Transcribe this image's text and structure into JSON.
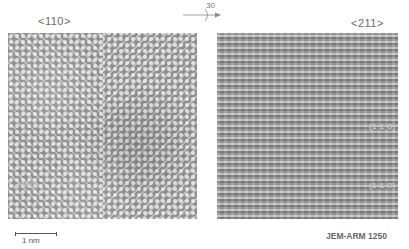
{
  "figure": {
    "left_panel": {
      "zone_axis_label": "<110>",
      "plane_label": "(200)",
      "pattern": "twinned-lattice-chevron"
    },
    "right_panel": {
      "zone_axis_label": "<211>",
      "plane_labels": [
        "(1 1 0)",
        "(1 1 0)"
      ],
      "pattern": "horizontal-fringes"
    },
    "rotation": {
      "angle_label": "30",
      "icon": "rotation-arrow-icon"
    },
    "scale_bar": {
      "label": "1 nm"
    },
    "instrument_label": "JEM-ARM 1250",
    "colors": {
      "background": "#ffffff",
      "image_gray": "#9a9a9a",
      "text": "#6a6a6a"
    }
  }
}
